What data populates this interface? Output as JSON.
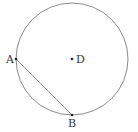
{
  "diagram": {
    "type": "geometry",
    "circle": {
      "center_label": "D",
      "stroke": "#8a8a8a"
    },
    "points": [
      {
        "label": "A",
        "x": 16,
        "y": 59
      },
      {
        "label": "B",
        "x": 72,
        "y": 115
      },
      {
        "label": "D",
        "x": 72,
        "y": 59
      }
    ],
    "segments": [
      {
        "from": "A",
        "to": "B"
      }
    ]
  }
}
